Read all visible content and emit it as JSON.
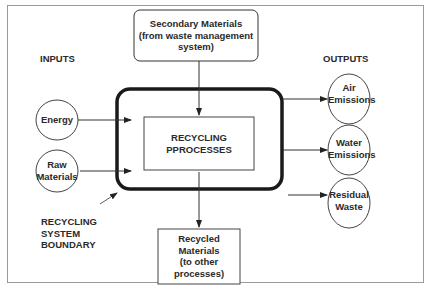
{
  "diagram": {
    "type": "flow-diagram",
    "headers": {
      "inputs": "INPUTS",
      "outputs": "OUTPUTS"
    },
    "top_box": {
      "line1": "Secondary Materials",
      "line2": "(from waste management",
      "line3": "system)"
    },
    "center_box": {
      "line1": "RECYCLING",
      "line2": "PPROCESSES"
    },
    "bottom_box": {
      "line1": "Recycled",
      "line2": "Materials",
      "line3": "(to other",
      "line4": "processes)"
    },
    "inputs": [
      {
        "line1": "Energy"
      },
      {
        "line1": "Raw",
        "line2": "Materials"
      }
    ],
    "outputs": [
      {
        "line1": "Air",
        "line2": "Emissions"
      },
      {
        "line1": "Water",
        "line2": "Emissions"
      },
      {
        "line1": "Residual",
        "line2": "Waste"
      }
    ],
    "boundary_label": {
      "line1": "RECYCLING",
      "line2": "SYSTEM",
      "line3": "BOUNDARY"
    },
    "colors": {
      "stroke": "#222222",
      "frame": "#9a9a9a",
      "background": "#ffffff"
    }
  }
}
